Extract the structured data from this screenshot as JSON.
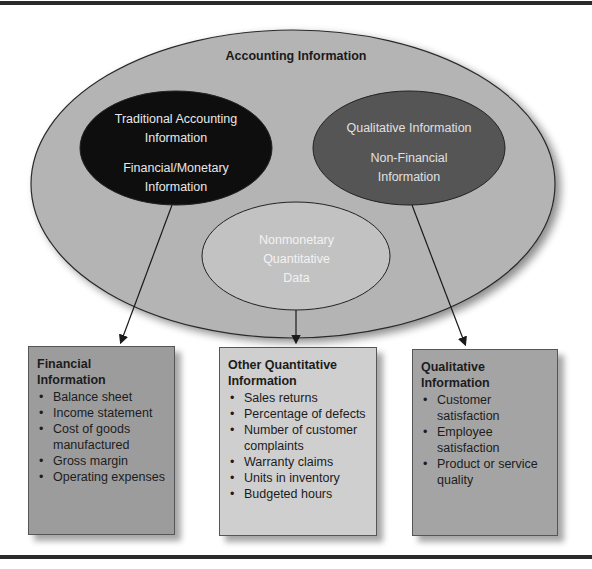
{
  "diagram": {
    "outer_ellipse": {
      "label": "Accounting Information",
      "fill": "#b4b4b4"
    },
    "ellipses": [
      {
        "id": "traditional",
        "lines": [
          "Traditional Accounting",
          "Information"
        ],
        "sub_lines": [
          "Financial/Monetary",
          "Information"
        ],
        "fill": "#0e0e0e"
      },
      {
        "id": "qualitative",
        "lines": [
          "Qualitative Information"
        ],
        "sub_lines": [
          "Non-Financial",
          "Information"
        ],
        "fill": "#555555"
      },
      {
        "id": "nonmonetary",
        "lines": [
          "Nonmonetary",
          "Quantitative",
          "Data"
        ],
        "fill": "#c2c2c2"
      }
    ],
    "boxes": [
      {
        "id": "financial",
        "title_lines": [
          "Financial",
          "Information"
        ],
        "items": [
          "Balance sheet",
          "Income statement",
          "Cost of goods manufactured",
          "Gross margin",
          "Operating expenses"
        ],
        "fill": "#9c9c9c"
      },
      {
        "id": "other-quantitative",
        "title_lines": [
          "Other Quantitative",
          "Information"
        ],
        "items": [
          "Sales returns",
          "Percentage of defects",
          "Number of customer complaints",
          "Warranty claims",
          "Units in inventory",
          "Budgeted hours"
        ],
        "fill": "#cfcfcf"
      },
      {
        "id": "qualitative",
        "title_lines": [
          "Qualitative",
          "Information"
        ],
        "items": [
          "Customer satisfaction",
          "Employee satisfaction",
          "Product or service quality"
        ],
        "fill": "#a4a4a4"
      }
    ]
  }
}
